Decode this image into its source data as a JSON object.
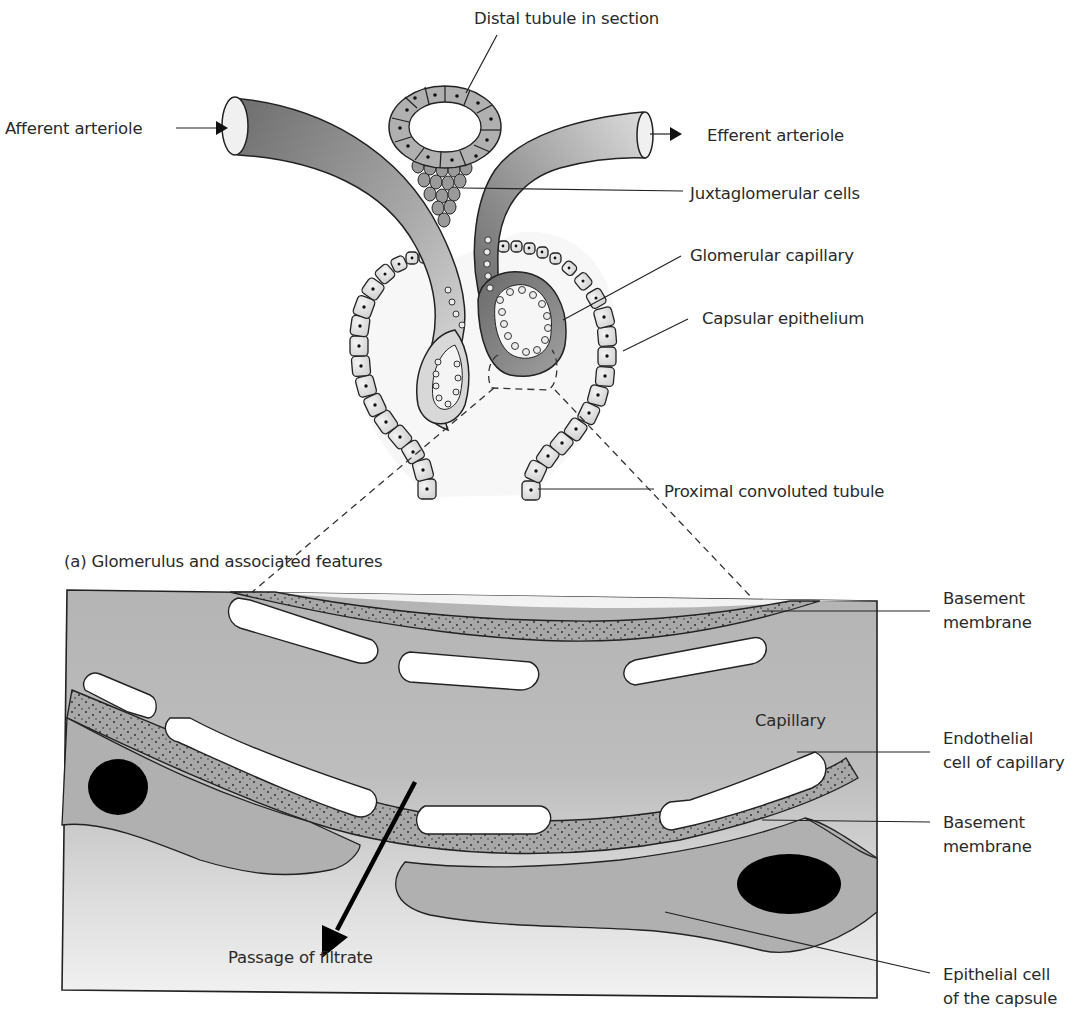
{
  "figure": {
    "top_panel": {
      "caption": "(a) Glomerulus and associated features",
      "labels": {
        "distal_tubule": "Distal tubule in section",
        "afferent_arteriole": "Afferent arteriole",
        "efferent_arteriole": "Efferent arteriole",
        "juxtaglomerular_cells": "Juxtaglomerular cells",
        "glomerular_capillary": "Glomerular capillary",
        "capsular_epithelium": "Capsular epithelium",
        "proximal_convoluted_tubule": "Proximal convoluted tubule"
      }
    },
    "bottom_panel": {
      "labels": {
        "basement_membrane_top_line1": "Basement",
        "basement_membrane_top_line2": "membrane",
        "capillary": "Capillary",
        "endothelial_line1": "Endothelial",
        "endothelial_line2": "cell of capillary",
        "basement_membrane_bottom_line1": "Basement",
        "basement_membrane_bottom_line2": "membrane",
        "passage_of_filtrate": "Passage of filtrate",
        "epithelial_line1": "Epithelial cell",
        "epithelial_line2": "of the capsule"
      }
    },
    "colors": {
      "ink": "#1a1a1a",
      "panel_gray": "#b8b8b8",
      "panel_light": "#ececec",
      "membrane": "#a9a9a9",
      "nucleus": "#000000"
    }
  }
}
